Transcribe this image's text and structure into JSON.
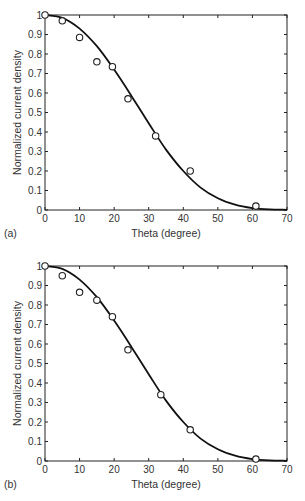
{
  "chart_data": [
    {
      "type": "scatter",
      "panel_label": "(a)",
      "title": "",
      "xlabel": "Theta (degree)",
      "ylabel": "Normalized current density",
      "xlim": [
        0,
        70
      ],
      "ylim": [
        0,
        1
      ],
      "xticks": [
        0,
        10,
        20,
        30,
        40,
        50,
        60,
        70
      ],
      "yticks": [
        0,
        0.1,
        0.2,
        0.3,
        0.4,
        0.5,
        0.6,
        0.7,
        0.8,
        0.9,
        1
      ],
      "ytick_labels": [
        "0",
        "0.1",
        "0.2",
        "0.3",
        "0.4",
        "0.5",
        "0.6",
        "0.7",
        "0.8",
        "0.9",
        "1"
      ],
      "grid": false,
      "legend": null,
      "series": [
        {
          "name": "measured",
          "style": "open-circle",
          "x": [
            0,
            5,
            10,
            15,
            19.5,
            24,
            32,
            42,
            61
          ],
          "y": [
            1.0,
            0.97,
            0.885,
            0.76,
            0.735,
            0.57,
            0.38,
            0.2,
            0.02
          ]
        },
        {
          "name": "fit",
          "style": "solid-line",
          "x": [
            0,
            5,
            10,
            15,
            20,
            25,
            30,
            35,
            40,
            45,
            50,
            55,
            60,
            65,
            70
          ],
          "y": [
            1.0,
            0.985,
            0.93,
            0.84,
            0.72,
            0.585,
            0.445,
            0.31,
            0.2,
            0.115,
            0.06,
            0.027,
            0.01,
            0.003,
            0.001
          ]
        }
      ]
    },
    {
      "type": "scatter",
      "panel_label": "(b)",
      "title": "",
      "xlabel": "Theta (degree)",
      "ylabel": "Normalized current density",
      "xlim": [
        0,
        70
      ],
      "ylim": [
        0,
        1
      ],
      "xticks": [
        0,
        10,
        20,
        30,
        40,
        50,
        60,
        70
      ],
      "yticks": [
        0,
        0.1,
        0.2,
        0.3,
        0.4,
        0.5,
        0.6,
        0.7,
        0.8,
        0.9,
        1
      ],
      "ytick_labels": [
        "0",
        "0.1",
        "0.2",
        "0.3",
        "0.4",
        "0.5",
        "0.6",
        "0.7",
        "0.8",
        "0.9",
        "1"
      ],
      "grid": false,
      "legend": null,
      "series": [
        {
          "name": "measured",
          "style": "open-circle",
          "x": [
            0,
            5,
            10,
            15,
            19.5,
            24,
            33.5,
            42,
            61
          ],
          "y": [
            1.0,
            0.95,
            0.865,
            0.825,
            0.74,
            0.57,
            0.34,
            0.16,
            0.01
          ]
        },
        {
          "name": "fit",
          "style": "solid-line",
          "x": [
            0,
            5,
            10,
            15,
            20,
            25,
            30,
            35,
            40,
            45,
            50,
            55,
            60,
            65,
            70
          ],
          "y": [
            1.0,
            0.985,
            0.93,
            0.84,
            0.72,
            0.585,
            0.445,
            0.31,
            0.2,
            0.115,
            0.06,
            0.027,
            0.01,
            0.003,
            0.001
          ]
        }
      ]
    }
  ],
  "panels": [
    {
      "label": "(a)",
      "xlabel": "Theta (degree)",
      "ylabel": "Normalized current density"
    },
    {
      "label": "(b)",
      "xlabel": "Theta (degree)",
      "ylabel": "Normalized current density"
    }
  ],
  "colors": {
    "axis": "#222222",
    "curve": "#111111",
    "marker": "#222222",
    "text": "#333333"
  }
}
